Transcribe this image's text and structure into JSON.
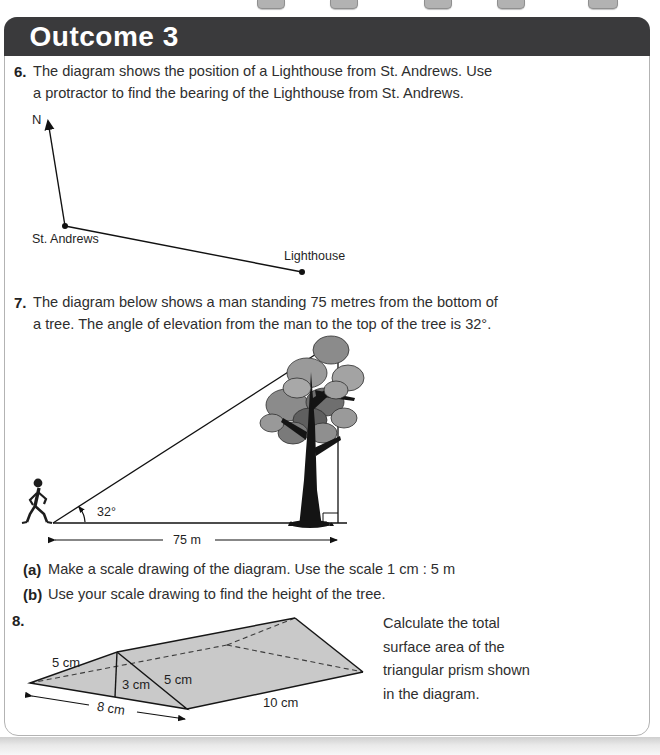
{
  "header": {
    "title": "Outcome 3"
  },
  "q6": {
    "number": "6.",
    "text_line1": "The diagram shows the position of a Lighthouse from St. Andrews. Use",
    "text_line2": "a protractor to find the bearing of the Lighthouse from St. Andrews.",
    "diagram": {
      "north_label": "N",
      "origin_label": "St. Andrews",
      "target_label": "Lighthouse"
    }
  },
  "q7": {
    "number": "7.",
    "text_line1": "The diagram below shows a man standing 75 metres from the bottom of",
    "text_line2": "a tree. The angle of elevation from the man to the top of the tree is 32°.",
    "diagram": {
      "angle_label": "32°",
      "distance_label": "75 m"
    },
    "parts": [
      {
        "label": "(a)",
        "text": "Make a scale drawing of the diagram. Use the scale 1 cm : 5 m"
      },
      {
        "label": "(b)",
        "text": "Use your scale drawing to find the height of the tree."
      }
    ]
  },
  "q8": {
    "number": "8.",
    "prompt_lines": [
      "Calculate the total",
      "surface area of the",
      "triangular prism shown",
      "in the diagram."
    ],
    "diagram": {
      "slant_left_label": "5 cm",
      "height_label": "3 cm",
      "slant_right_label": "5 cm",
      "base_label": "8 cm",
      "length_label": "10 cm"
    }
  },
  "colors": {
    "header_bg": "#3a3a3c",
    "prism_fill": "#c9c9c9",
    "page_border": "#b3b3b3"
  }
}
